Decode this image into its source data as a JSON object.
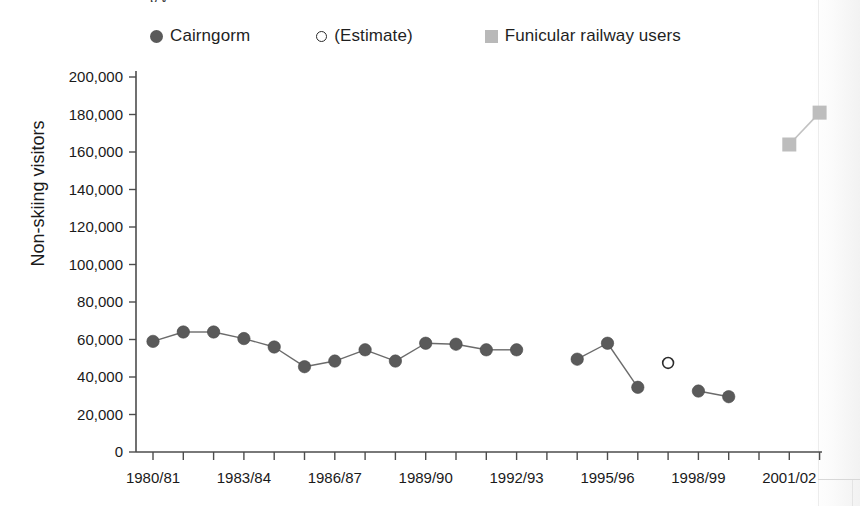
{
  "caption": {
    "cut_off_line": "p          y"
  },
  "legend": {
    "items": [
      {
        "marker": "filled-circle-icon",
        "label": "Cairngorm",
        "color": "#5a5a5a"
      },
      {
        "marker": "open-circle-icon",
        "label": "(Estimate)",
        "color": "#2b2b2b"
      },
      {
        "marker": "filled-square-icon",
        "label": "Funicular railway users",
        "color": "#b9b9b9"
      }
    ]
  },
  "axes": {
    "y_title": "Non-skiing visitors",
    "x_title": ""
  },
  "chart_data": {
    "type": "line",
    "title": "",
    "subtitle": "",
    "xlabel": "",
    "ylabel": "Non-skiing visitors",
    "ylim": [
      0,
      200000
    ],
    "yticks": [
      0,
      20000,
      40000,
      60000,
      80000,
      100000,
      120000,
      140000,
      160000,
      180000,
      200000
    ],
    "ytick_labels": [
      "0",
      "20,000",
      "40,000",
      "60,000",
      "80,000",
      "100,000",
      "120,000",
      "140,000",
      "160,000",
      "180,000",
      "200,000"
    ],
    "grid": false,
    "legend_position": "top",
    "x": [
      "1980/81",
      "1981/82",
      "1982/83",
      "1983/84",
      "1984/85",
      "1985/86",
      "1986/87",
      "1987/88",
      "1988/89",
      "1989/90",
      "1990/91",
      "1991/92",
      "1992/93",
      "1993/94",
      "1994/95",
      "1995/96",
      "1996/97",
      "1997/98",
      "1998/99",
      "1999/00",
      "2000/01",
      "2001/02",
      "2002/03"
    ],
    "xtick_labels": [
      "1980/81",
      "1983/84",
      "1986/87",
      "1989/90",
      "1992/93",
      "1995/96",
      "1998/99",
      "2001/02"
    ],
    "xtick_label_every": 3,
    "series": [
      {
        "name": "Cairngorm",
        "marker": "filled-circle",
        "color": "#5a5a5a",
        "points": [
          {
            "x": "1980/81",
            "y": 59000
          },
          {
            "x": "1981/82",
            "y": 64000
          },
          {
            "x": "1982/83",
            "y": 64000
          },
          {
            "x": "1983/84",
            "y": 60500
          },
          {
            "x": "1984/85",
            "y": 56000
          },
          {
            "x": "1985/86",
            "y": 45500
          },
          {
            "x": "1986/87",
            "y": 48500
          },
          {
            "x": "1987/88",
            "y": 54500
          },
          {
            "x": "1988/89",
            "y": 48500
          },
          {
            "x": "1989/90",
            "y": 58000
          },
          {
            "x": "1990/91",
            "y": 57500
          },
          {
            "x": "1991/92",
            "y": 54500
          },
          {
            "x": "1992/93",
            "y": 54500
          },
          {
            "x": "1994/95",
            "y": 49500
          },
          {
            "x": "1995/96",
            "y": 58000
          },
          {
            "x": "1996/97",
            "y": 34500
          },
          {
            "x": "1998/99",
            "y": 32500
          },
          {
            "x": "1999/00",
            "y": 29500
          }
        ]
      },
      {
        "name": "(Estimate)",
        "marker": "open-circle",
        "color": "#2b2b2b",
        "points": [
          {
            "x": "1997/98",
            "y": 47500
          }
        ]
      },
      {
        "name": "Funicular railway users",
        "marker": "filled-square",
        "color": "#bdbdbd",
        "points": [
          {
            "x": "2001/02",
            "y": 164000
          },
          {
            "x": "2002/03",
            "y": 181000
          }
        ]
      }
    ]
  }
}
